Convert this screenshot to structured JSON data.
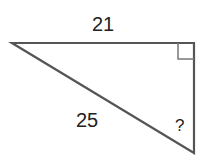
{
  "diagram": {
    "type": "right-triangle",
    "labels": {
      "top_side": "21",
      "hypotenuse": "25",
      "unknown_side": "?"
    },
    "right_angle_marker": "top-right",
    "stroke_color": "#555555"
  }
}
